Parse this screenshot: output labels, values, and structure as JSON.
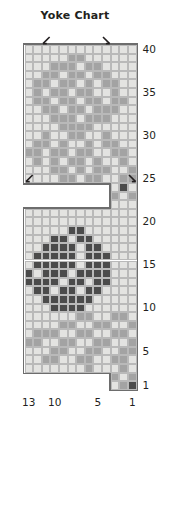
{
  "chart": {
    "title": "Yoke Chart",
    "type": "knitting-colorwork-chart",
    "columns": 13,
    "rows": 40,
    "column_direction": "right-to-left",
    "row_direction": "bottom-to-top",
    "colors": {
      "light": "#e3e3e1",
      "medium": "#a3a3a3",
      "dark": "#4b4b4b",
      "empty": "#ffffff",
      "gridline": "#b9b9b9",
      "edge": "#6d6d6d",
      "text": "#231f20"
    },
    "row_labels": [
      "40",
      "35",
      "30",
      "25",
      "20",
      "15",
      "10",
      "5",
      "1"
    ],
    "row_label_rows": [
      40,
      35,
      30,
      25,
      20,
      15,
      10,
      5,
      1
    ],
    "column_labels": [
      "13",
      "10",
      "5",
      "1"
    ],
    "column_label_cols": [
      13,
      10,
      5,
      1
    ],
    "symbols": [
      {
        "name": "left-leaning-decrease",
        "row": 41,
        "col": 11,
        "glyph": "ssk"
      },
      {
        "name": "right-leaning-decrease",
        "row": 41,
        "col": 4,
        "glyph": "k2tog"
      },
      {
        "name": "left-leaning-decrease",
        "row": 25,
        "col": 13,
        "glyph": "ssk"
      },
      {
        "name": "right-leaning-decrease",
        "row": 25,
        "col": 1,
        "glyph": "k2tog"
      }
    ],
    "legend_note": "",
    "grid": [
      {
        "row": 40,
        "cells": [
          "L",
          "L",
          "L",
          "L",
          "L",
          "L",
          "L",
          "L",
          "L",
          "L",
          "L",
          "L",
          "L"
        ]
      },
      {
        "row": 39,
        "cells": [
          "L",
          "L",
          "L",
          "L",
          "L",
          "M",
          "M",
          "L",
          "L",
          "L",
          "L",
          "L",
          "L"
        ]
      },
      {
        "row": 38,
        "cells": [
          "L",
          "L",
          "L",
          "M",
          "M",
          "M",
          "L",
          "M",
          "M",
          "L",
          "L",
          "L",
          "L"
        ]
      },
      {
        "row": 37,
        "cells": [
          "L",
          "L",
          "M",
          "M",
          "L",
          "M",
          "M",
          "L",
          "M",
          "M",
          "L",
          "L",
          "L"
        ]
      },
      {
        "row": 36,
        "cells": [
          "L",
          "M",
          "M",
          "L",
          "M",
          "M",
          "L",
          "M",
          "L",
          "M",
          "M",
          "L",
          "L"
        ]
      },
      {
        "row": 35,
        "cells": [
          "L",
          "M",
          "L",
          "M",
          "M",
          "L",
          "M",
          "M",
          "L",
          "L",
          "M",
          "L",
          "L"
        ]
      },
      {
        "row": 34,
        "cells": [
          "L",
          "M",
          "M",
          "L",
          "M",
          "M",
          "L",
          "M",
          "M",
          "L",
          "M",
          "M",
          "L"
        ]
      },
      {
        "row": 33,
        "cells": [
          "L",
          "L",
          "M",
          "M",
          "L",
          "M",
          "M",
          "L",
          "M",
          "M",
          "M",
          "L",
          "L"
        ]
      },
      {
        "row": 32,
        "cells": [
          "L",
          "L",
          "L",
          "M",
          "M",
          "M",
          "L",
          "M",
          "M",
          "M",
          "L",
          "L",
          "L"
        ]
      },
      {
        "row": 31,
        "cells": [
          "L",
          "L",
          "L",
          "L",
          "M",
          "M",
          "M",
          "M",
          "L",
          "L",
          "L",
          "L",
          "L"
        ]
      },
      {
        "row": 30,
        "cells": [
          "L",
          "L",
          "M",
          "L",
          "L",
          "M",
          "M",
          "L",
          "L",
          "M",
          "L",
          "L",
          "L"
        ]
      },
      {
        "row": 29,
        "cells": [
          "L",
          "M",
          "M",
          "L",
          "M",
          "L",
          "L",
          "M",
          "L",
          "M",
          "M",
          "L",
          "L"
        ]
      },
      {
        "row": 28,
        "cells": [
          "M",
          "M",
          "L",
          "M",
          "M",
          "L",
          "M",
          "M",
          "L",
          "L",
          "M",
          "M",
          "L"
        ]
      },
      {
        "row": 27,
        "cells": [
          "L",
          "M",
          "L",
          "M",
          "L",
          "M",
          "M",
          "L",
          "M",
          "L",
          "L",
          "M",
          "L"
        ]
      },
      {
        "row": 26,
        "cells": [
          "L",
          "L",
          "L",
          "M",
          "M",
          "L",
          "M",
          "L",
          "M",
          "M",
          "L",
          "L",
          "M"
        ]
      },
      {
        "row": 25,
        "cells": [
          "L",
          "L",
          "L",
          "L",
          "M",
          "M",
          "L",
          "M",
          "M",
          "L",
          "L",
          "M",
          "M"
        ]
      },
      {
        "row": 24,
        "cells": [
          "E",
          "E",
          "E",
          "E",
          "E",
          "E",
          "E",
          "E",
          "E",
          "E",
          "L",
          "D",
          "L"
        ]
      },
      {
        "row": 23,
        "cells": [
          "E",
          "E",
          "E",
          "E",
          "E",
          "E",
          "E",
          "E",
          "E",
          "E",
          "M",
          "L",
          "M"
        ]
      },
      {
        "row": 22,
        "cells": [
          "E",
          "E",
          "E",
          "E",
          "E",
          "E",
          "E",
          "E",
          "E",
          "E",
          "L",
          "L",
          "L"
        ]
      },
      {
        "row": 21,
        "cells": [
          "L",
          "L",
          "L",
          "L",
          "L",
          "L",
          "L",
          "L",
          "L",
          "L",
          "L",
          "L",
          "L"
        ]
      },
      {
        "row": 20,
        "cells": [
          "L",
          "L",
          "L",
          "L",
          "L",
          "L",
          "L",
          "L",
          "L",
          "L",
          "L",
          "L",
          "L"
        ]
      },
      {
        "row": 19,
        "cells": [
          "L",
          "L",
          "L",
          "L",
          "L",
          "D",
          "D",
          "L",
          "L",
          "L",
          "L",
          "L",
          "L"
        ]
      },
      {
        "row": 18,
        "cells": [
          "L",
          "L",
          "L",
          "D",
          "D",
          "L",
          "D",
          "D",
          "L",
          "L",
          "L",
          "L",
          "L"
        ]
      },
      {
        "row": 17,
        "cells": [
          "L",
          "L",
          "D",
          "D",
          "D",
          "D",
          "L",
          "D",
          "D",
          "L",
          "L",
          "L",
          "L"
        ]
      },
      {
        "row": 16,
        "cells": [
          "L",
          "D",
          "D",
          "D",
          "D",
          "D",
          "L",
          "D",
          "D",
          "D",
          "L",
          "L",
          "L"
        ]
      },
      {
        "row": 15,
        "cells": [
          "L",
          "D",
          "D",
          "D",
          "D",
          "D",
          "L",
          "D",
          "D",
          "D",
          "L",
          "L",
          "L"
        ]
      },
      {
        "row": 14,
        "cells": [
          "D",
          "L",
          "D",
          "D",
          "D",
          "L",
          "D",
          "D",
          "D",
          "D",
          "L",
          "L",
          "L"
        ]
      },
      {
        "row": 13,
        "cells": [
          "D",
          "D",
          "D",
          "D",
          "L",
          "D",
          "D",
          "L",
          "D",
          "D",
          "L",
          "L",
          "L"
        ]
      },
      {
        "row": 12,
        "cells": [
          "L",
          "D",
          "D",
          "L",
          "D",
          "D",
          "L",
          "D",
          "D",
          "L",
          "L",
          "L",
          "L"
        ]
      },
      {
        "row": 11,
        "cells": [
          "L",
          "L",
          "D",
          "D",
          "D",
          "D",
          "D",
          "D",
          "L",
          "L",
          "L",
          "L",
          "L"
        ]
      },
      {
        "row": 10,
        "cells": [
          "L",
          "L",
          "L",
          "D",
          "D",
          "D",
          "D",
          "L",
          "L",
          "L",
          "L",
          "L",
          "L"
        ]
      },
      {
        "row": 9,
        "cells": [
          "L",
          "L",
          "L",
          "L",
          "L",
          "L",
          "M",
          "M",
          "L",
          "L",
          "M",
          "M",
          "L"
        ]
      },
      {
        "row": 8,
        "cells": [
          "L",
          "L",
          "L",
          "L",
          "M",
          "M",
          "L",
          "L",
          "M",
          "M",
          "L",
          "L",
          "M"
        ]
      },
      {
        "row": 7,
        "cells": [
          "L",
          "M",
          "M",
          "M",
          "L",
          "L",
          "M",
          "M",
          "L",
          "L",
          "M",
          "M",
          "L"
        ]
      },
      {
        "row": 6,
        "cells": [
          "M",
          "M",
          "L",
          "L",
          "M",
          "M",
          "L",
          "L",
          "M",
          "M",
          "L",
          "L",
          "M"
        ]
      },
      {
        "row": 5,
        "cells": [
          "L",
          "L",
          "L",
          "M",
          "M",
          "L",
          "L",
          "M",
          "M",
          "L",
          "L",
          "M",
          "M"
        ]
      },
      {
        "row": 4,
        "cells": [
          "L",
          "L",
          "M",
          "M",
          "L",
          "L",
          "M",
          "M",
          "L",
          "L",
          "M",
          "M",
          "L"
        ]
      },
      {
        "row": 3,
        "cells": [
          "L",
          "L",
          "L",
          "L",
          "L",
          "L",
          "L",
          "M",
          "L",
          "L",
          "L",
          "M",
          "L"
        ]
      },
      {
        "row": 2,
        "cells": [
          "E",
          "E",
          "E",
          "E",
          "E",
          "E",
          "E",
          "E",
          "E",
          "E",
          "M",
          "L",
          "M"
        ]
      },
      {
        "row": 1,
        "cells": [
          "E",
          "E",
          "E",
          "E",
          "E",
          "E",
          "E",
          "E",
          "E",
          "E",
          "L",
          "M",
          "D"
        ]
      }
    ]
  }
}
